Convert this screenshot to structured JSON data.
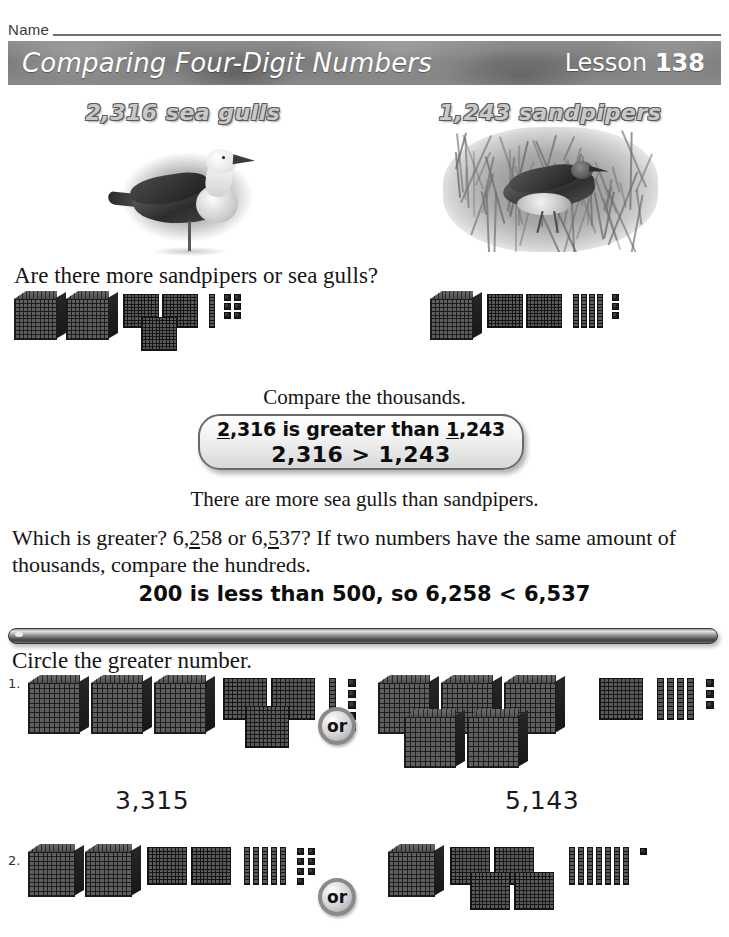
{
  "header": {
    "name_label": "Name",
    "title": "Comparing Four-Digit Numbers",
    "lesson_word": "Lesson",
    "lesson_number": "138"
  },
  "photos": [
    {
      "caption": "2,316 sea gulls",
      "alt_name": "sea-gull-photo"
    },
    {
      "caption": "1,243 sandpipers",
      "alt_name": "sandpiper-photo"
    }
  ],
  "lesson": {
    "question": "Are there more sandpipers or sea gulls?",
    "compare_prompt": "Compare the thousands.",
    "callout_line1_pre": "",
    "callout_line1_a_underline": "2",
    "callout_line1_a_rest": ",316 is greater than ",
    "callout_line1_b_underline": "1",
    "callout_line1_b_rest": ",243",
    "callout_line2": "2,316 > 1,243",
    "conclusion": "There are more sea gulls than sandpipers.",
    "para_part1": "Which is greater? 6,",
    "para_u1": "2",
    "para_part2": "58 or 6,",
    "para_u2": "5",
    "para_part3": "37? If two numbers have the same",
    "para_line2": "amount of thousands, compare the hundreds.",
    "bold_rule": "200 is less than 500, so 6,258 < 6,537"
  },
  "exercises": {
    "instruction": "Circle the greater number.",
    "or_label": "or",
    "items": [
      {
        "number": "1.",
        "left": {
          "value": "3,315",
          "cubes": 3,
          "flats": 3,
          "rods": 1,
          "units": 5
        },
        "right": {
          "value": "5,143",
          "cubes": 5,
          "flats": 1,
          "rods": 4,
          "units": 3
        }
      },
      {
        "number": "2.",
        "left": {
          "value": "",
          "cubes": 2,
          "flats": 2,
          "rods": 5,
          "units": 7
        },
        "right": {
          "value": "",
          "cubes": 1,
          "flats": 4,
          "rods": 7,
          "units": 1
        }
      }
    ]
  },
  "demo_blocks": {
    "left": {
      "cubes": 2,
      "flats": 3,
      "rods": 1,
      "units": 6
    },
    "right": {
      "cubes": 1,
      "flats": 2,
      "rods": 4,
      "units": 3
    }
  },
  "colors": {
    "band": "#7b7b7b",
    "block": "#5a5a5a",
    "ink": "#151515",
    "caption_fill": "#c9c9c9",
    "caption_stroke": "#5a5a5a"
  }
}
